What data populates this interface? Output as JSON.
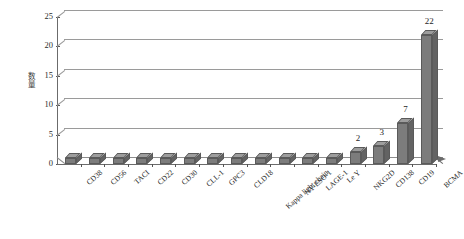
{
  "chart_data": {
    "type": "bar",
    "title": "",
    "xlabel": "",
    "ylabel": "数量",
    "ylim": [
      0,
      25
    ],
    "yticks": [
      0,
      5,
      10,
      15,
      20,
      25
    ],
    "grid": true,
    "legend": null,
    "style": "3d-column",
    "bar_color": "#7c7c7c",
    "categories": [
      "CD38",
      "CD56",
      "TACI",
      "CD22",
      "CD30",
      "CLL-1",
      "GPC3",
      "CLD18",
      "Kappa light chain",
      "NY-ESO-1",
      "LAGE-1",
      "Le Y",
      "NKG2D",
      "CD138",
      "CD19",
      "BCMA"
    ],
    "values": [
      1,
      1,
      1,
      1,
      1,
      1,
      1,
      1,
      1,
      1,
      1,
      1,
      2,
      3,
      7,
      22
    ],
    "data_labels": [
      "",
      "",
      "",
      "",
      "",
      "",
      "",
      "",
      "",
      "",
      "",
      "",
      "2",
      "3",
      "7",
      "22"
    ]
  }
}
